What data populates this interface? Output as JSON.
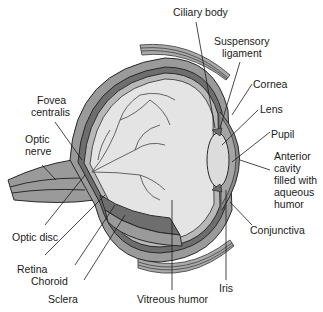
{
  "diagram": {
    "type": "anatomical-cross-section",
    "colors": {
      "background": "#ffffff",
      "sclera": "#9a9a9a",
      "choroid": "#6e6e6e",
      "retina": "#b8b8b8",
      "vitreous": "#e4e4e4",
      "lens": "#dcdcdc",
      "vessels": "#555555",
      "outline": "#2a2a2a"
    },
    "labels": {
      "ciliary_body": "Ciliary body",
      "suspensory_ligament_1": "Suspensory",
      "suspensory_ligament_2": "ligament",
      "cornea": "Cornea",
      "lens": "Lens",
      "pupil": "Pupil",
      "anterior_1": "Anterior",
      "anterior_2": "cavity",
      "anterior_3": "filled with",
      "anterior_4": "aqueous",
      "anterior_5": "humor",
      "conjunctiva": "Conjunctiva",
      "iris": "Iris",
      "vitreous_humor": "Vitreous humor",
      "sclera": "Sclera",
      "choroid": "Choroid",
      "retina": "Retina",
      "optic_disc": "Optic disc",
      "optic_nerve_1": "Optic",
      "optic_nerve_2": "nerve",
      "fovea_1": "Fovea",
      "fovea_2": "centralis"
    }
  }
}
